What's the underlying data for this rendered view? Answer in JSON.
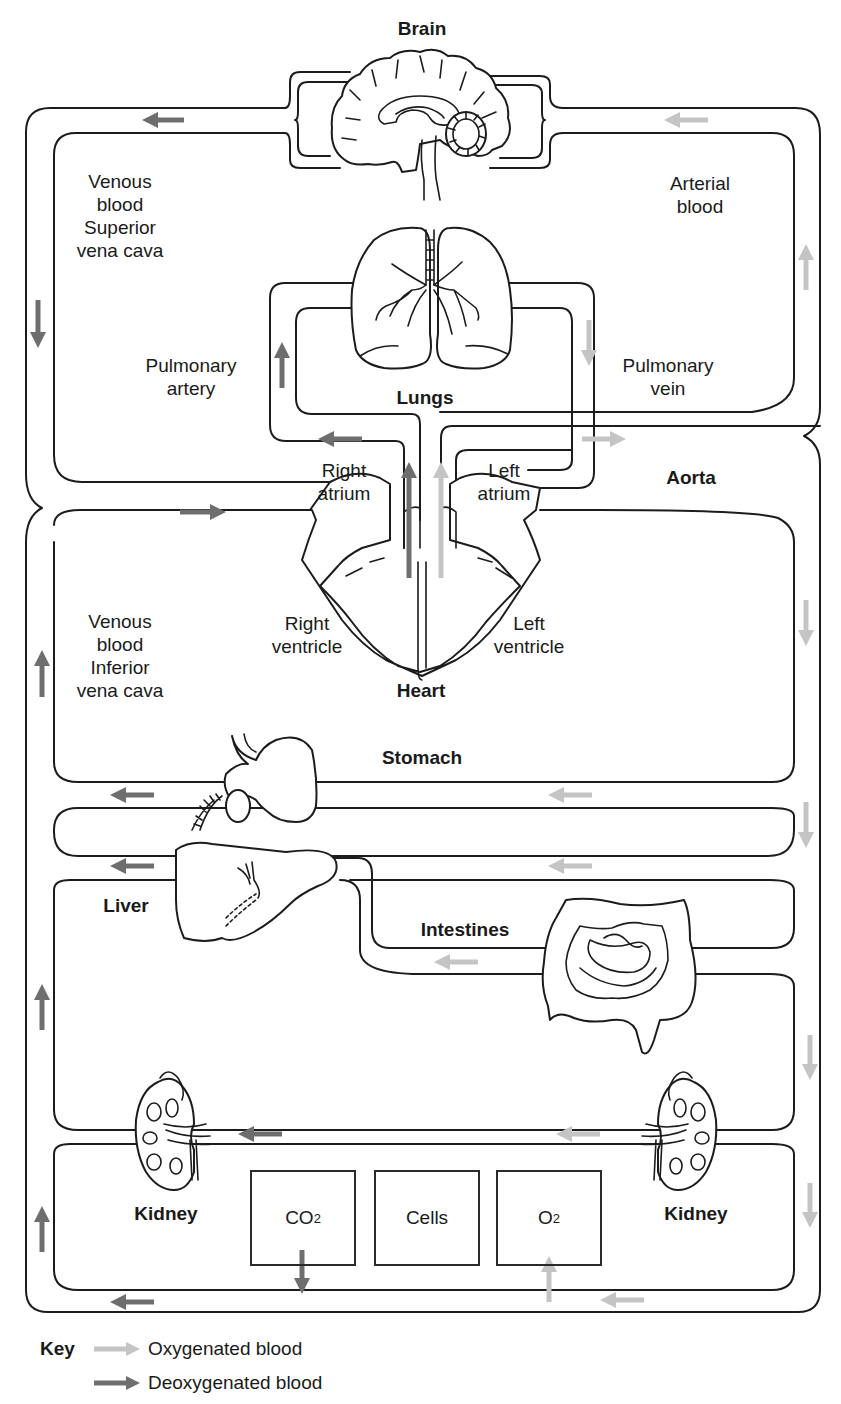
{
  "title": "Brain",
  "colors": {
    "oxygenated": "#c4c4c4",
    "deoxygenated": "#6e6e6e",
    "outline": "#1c1c1c"
  },
  "organs": {
    "brain": "Brain",
    "lungs": "Lungs",
    "heart": "Heart",
    "aorta": "Aorta",
    "stomach": "Stomach",
    "liver": "Liver",
    "intestines": "Intestines",
    "kidney_left": "Kidney",
    "kidney_right": "Kidney"
  },
  "labels": {
    "venous_superior": [
      "Venous",
      "blood",
      "Superior",
      "vena cava"
    ],
    "arterial": [
      "Arterial",
      "blood"
    ],
    "pulmonary_artery": [
      "Pulmonary",
      "artery"
    ],
    "pulmonary_vein": [
      "Pulmonary",
      "vein"
    ],
    "right_atrium": [
      "Right",
      "atrium"
    ],
    "left_atrium": [
      "Left",
      "atrium"
    ],
    "right_ventricle": [
      "Right",
      "ventricle"
    ],
    "left_ventricle": [
      "Left",
      "ventricle"
    ],
    "venous_inferior": [
      "Venous",
      "blood",
      "Inferior",
      "vena cava"
    ]
  },
  "cells_boxes": {
    "co2": {
      "main": "CO",
      "sub": "2"
    },
    "cells": "Cells",
    "o2": {
      "main": "O",
      "sub": "2"
    }
  },
  "key": {
    "title": "Key",
    "items": [
      {
        "label": "Oxygenated blood",
        "type": "oxygenated"
      },
      {
        "label": "Deoxygenated blood",
        "type": "deoxygenated"
      }
    ]
  }
}
